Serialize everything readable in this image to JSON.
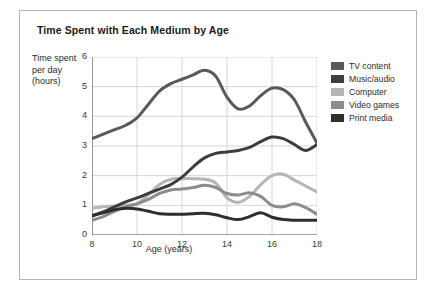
{
  "figure": {
    "title": "Time Spent with Each Medium by Age",
    "border_color": "#b4b4b4",
    "background": "#ffffff"
  },
  "axes": {
    "y_title": "Time spent per day (hours)",
    "x_title": "Age (years)",
    "y_ticks": [
      "0",
      "1",
      "2",
      "3",
      "4",
      "5",
      "6"
    ],
    "x_ticks": [
      "8",
      "10",
      "12",
      "14",
      "16",
      "18"
    ],
    "axis_color": "#555555",
    "grid_color": "#cccccc"
  },
  "legend": {
    "position": "right",
    "items": [
      {
        "label": "TV content",
        "color": "#595959"
      },
      {
        "label": "Music/audio",
        "color": "#3d3d3d"
      },
      {
        "label": "Computer",
        "color": "#b5b5b5"
      },
      {
        "label": "Video games",
        "color": "#8c8c8c"
      },
      {
        "label": "Print media",
        "color": "#2e2e2e"
      }
    ]
  },
  "chart_data": {
    "type": "line",
    "title": "Time Spent with Each Medium by Age",
    "xlabel": "Age (years)",
    "ylabel": "Time spent per day (hours)",
    "xlim": [
      8,
      18
    ],
    "ylim": [
      0,
      6
    ],
    "xticks": [
      8,
      10,
      12,
      14,
      16,
      18
    ],
    "yticks": [
      0,
      1,
      2,
      3,
      4,
      5,
      6
    ],
    "grid": true,
    "legend_position": "right",
    "x": [
      8,
      8.5,
      9,
      9.5,
      10,
      10.5,
      11,
      11.5,
      12,
      12.5,
      13,
      13.5,
      14,
      14.5,
      15,
      15.5,
      16,
      16.5,
      17,
      17.5,
      18
    ],
    "series": [
      {
        "name": "TV content",
        "color": "#595959",
        "values": [
          3.25,
          3.4,
          3.55,
          3.7,
          3.95,
          4.4,
          4.85,
          5.1,
          5.25,
          5.4,
          5.55,
          5.35,
          4.65,
          4.25,
          4.35,
          4.7,
          4.95,
          4.9,
          4.55,
          3.8,
          3.1
        ]
      },
      {
        "name": "Music/audio",
        "color": "#3d3d3d",
        "values": [
          0.65,
          0.78,
          0.95,
          1.12,
          1.25,
          1.4,
          1.55,
          1.7,
          1.95,
          2.3,
          2.6,
          2.75,
          2.8,
          2.85,
          2.95,
          3.15,
          3.3,
          3.25,
          3.05,
          2.85,
          3.05
        ]
      },
      {
        "name": "Computer",
        "color": "#b5b5b5",
        "values": [
          0.9,
          0.95,
          0.98,
          1.0,
          1.05,
          1.35,
          1.7,
          1.88,
          1.9,
          1.9,
          1.88,
          1.75,
          1.25,
          1.1,
          1.3,
          1.7,
          2.0,
          2.05,
          1.85,
          1.65,
          1.45
        ]
      },
      {
        "name": "Video games",
        "color": "#8c8c8c",
        "values": [
          0.5,
          0.62,
          0.8,
          0.95,
          1.05,
          1.2,
          1.4,
          1.52,
          1.55,
          1.6,
          1.68,
          1.6,
          1.4,
          1.35,
          1.42,
          1.3,
          1.0,
          0.95,
          1.05,
          0.92,
          0.7
        ]
      },
      {
        "name": "Print media",
        "color": "#2e2e2e",
        "values": [
          0.65,
          0.75,
          0.85,
          0.9,
          0.88,
          0.8,
          0.72,
          0.7,
          0.7,
          0.72,
          0.73,
          0.68,
          0.58,
          0.52,
          0.62,
          0.75,
          0.6,
          0.52,
          0.5,
          0.5,
          0.5
        ]
      }
    ]
  }
}
